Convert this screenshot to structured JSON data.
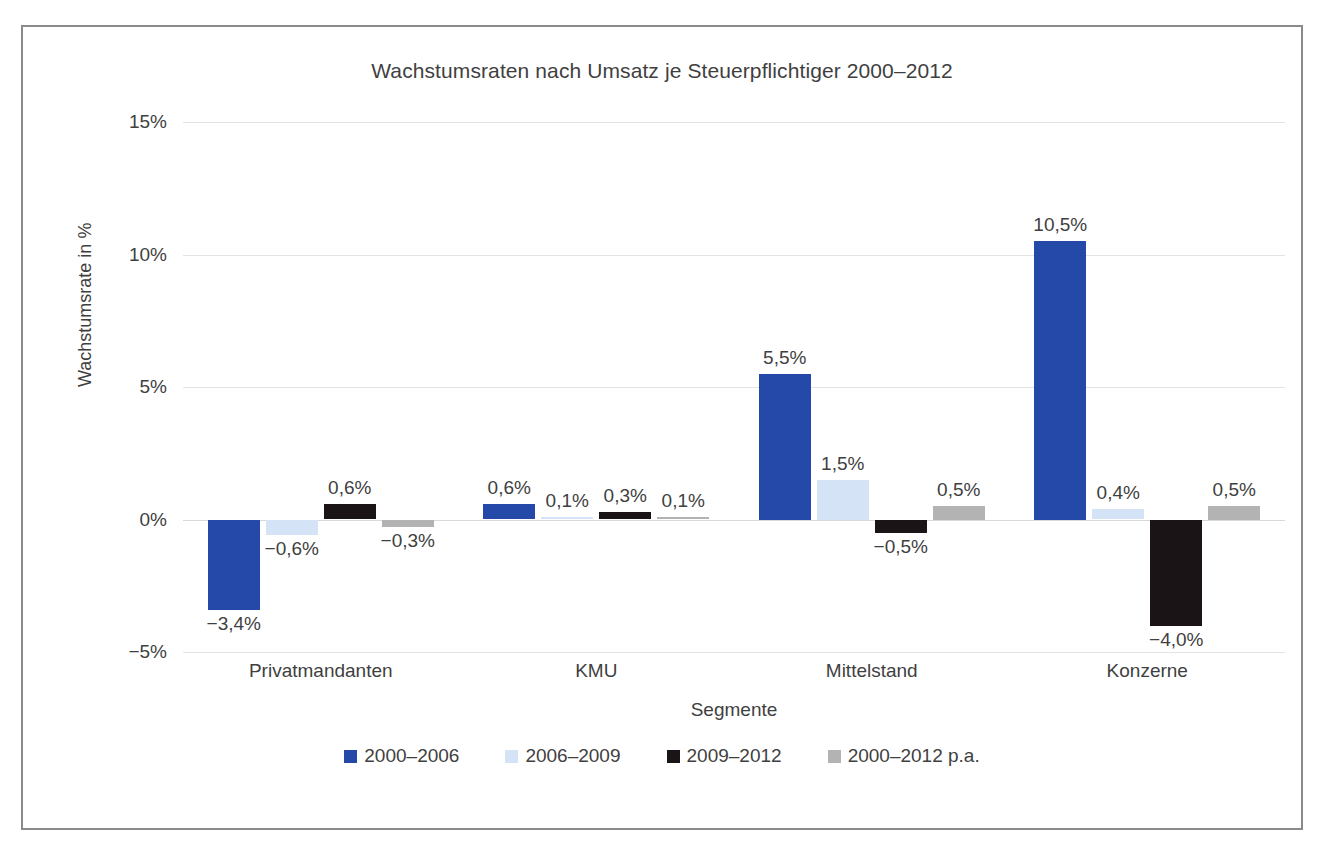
{
  "chart_data": {
    "type": "bar",
    "title": "Wachstumsraten nach Umsatz je Steuerpflichtiger 2000–2012",
    "xlabel": "Segmente",
    "ylabel": "Wachstumsrate in %",
    "categories": [
      "Privatmandanten",
      "KMU",
      "Mittelstand",
      "Konzerne"
    ],
    "ylim": [
      -5,
      15
    ],
    "yticks": [
      15,
      10,
      5,
      0,
      -5
    ],
    "ytick_labels": [
      "15%",
      "10%",
      "5%",
      "0%",
      "−5%"
    ],
    "grid": true,
    "legend_position": "bottom",
    "series": [
      {
        "name": "2000–2006",
        "color": "#2449A8",
        "values": [
          -3.4,
          0.6,
          5.5,
          10.5
        ],
        "labels": [
          "−3,4%",
          "0,6%",
          "5,5%",
          "10,5%"
        ]
      },
      {
        "name": "2006–2009",
        "color": "#D4E3F6",
        "values": [
          -0.6,
          0.1,
          1.5,
          0.4
        ],
        "labels": [
          "−0,6%",
          "0,1%",
          "1,5%",
          "0,4%"
        ]
      },
      {
        "name": "2009–2012",
        "color": "#1A1416",
        "values": [
          0.6,
          0.3,
          -0.5,
          -4.0
        ],
        "labels": [
          "0,6%",
          "0,3%",
          "−0,5%",
          "−4,0%"
        ]
      },
      {
        "name": "2000–2012 p.a.",
        "color": "#B3B3B3",
        "values": [
          -0.3,
          0.1,
          0.5,
          0.5
        ],
        "labels": [
          "−0,3%",
          "0,1%",
          "0,5%",
          "0,5%"
        ]
      }
    ]
  },
  "chart": {
    "title": "Wachstumsraten nach Umsatz je Steuerpflichtiger 2000–2012",
    "xaxis_title": "Segmente",
    "yaxis_title": "Wachstumsrate in %"
  }
}
